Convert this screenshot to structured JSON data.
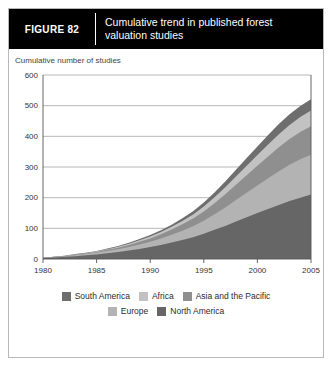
{
  "figure": {
    "label": "FIGURE  82",
    "title": "Cumulative trend in published forest valuation studies"
  },
  "axis_caption": "Cumulative number of studies",
  "colors": {
    "south_america": "#6e6e6e",
    "africa": "#c2c2c2",
    "asia_pacific": "#8f8f8f",
    "europe": "#b3b3b3",
    "north_america": "#666666",
    "gridline": "#9a9a9a",
    "axis": "#555555",
    "header_bg": "#000000",
    "card_border": "#b9b9b9"
  },
  "legend": {
    "row1": [
      {
        "label": "South America",
        "color_key": "south_america"
      },
      {
        "label": "Africa",
        "color_key": "africa"
      },
      {
        "label": "Asia and the Pacific",
        "color_key": "asia_pacific"
      }
    ],
    "row2": [
      {
        "label": "Europe",
        "color_key": "europe"
      },
      {
        "label": "North America",
        "color_key": "north_america"
      }
    ]
  },
  "chart_data": {
    "type": "area",
    "stacked": true,
    "title": "Cumulative trend in published forest valuation studies",
    "xlabel": "",
    "ylabel": "Cumulative number of studies",
    "xlim": [
      1980,
      2005
    ],
    "ylim": [
      0,
      600
    ],
    "ytick_step": 100,
    "xtick_step": 5,
    "grid": true,
    "legend_position": "bottom",
    "xticks": [
      1980,
      1985,
      1990,
      1995,
      2000,
      2005
    ],
    "xtick_labels": [
      "1980",
      "1985",
      "1990",
      "1995",
      "2000",
      "2005"
    ],
    "yticks": [
      0,
      100,
      200,
      300,
      400,
      500,
      600
    ],
    "ytick_labels": [
      "0",
      "100",
      "200",
      "300",
      "400",
      "500",
      "600"
    ],
    "x": [
      1980,
      1981,
      1982,
      1983,
      1984,
      1985,
      1986,
      1987,
      1988,
      1989,
      1990,
      1991,
      1992,
      1993,
      1994,
      1995,
      1996,
      1997,
      1998,
      1999,
      2000,
      2001,
      2002,
      2003,
      2004,
      2005
    ],
    "series": [
      {
        "name": "North America",
        "color_key": "north_america",
        "values": [
          3,
          5,
          7,
          9,
          12,
          15,
          19,
          23,
          28,
          33,
          39,
          46,
          54,
          62,
          71,
          82,
          95,
          108,
          122,
          136,
          150,
          163,
          176,
          189,
          200,
          210
        ]
      },
      {
        "name": "Europe",
        "color_key": "europe",
        "values": [
          1,
          1,
          2,
          3,
          4,
          5,
          7,
          9,
          11,
          14,
          17,
          21,
          25,
          30,
          36,
          43,
          51,
          60,
          70,
          80,
          90,
          100,
          110,
          118,
          125,
          130
        ]
      },
      {
        "name": "Asia and the Pacific",
        "color_key": "asia_pacific",
        "values": [
          0,
          1,
          1,
          2,
          2,
          3,
          4,
          5,
          7,
          9,
          11,
          14,
          17,
          21,
          25,
          30,
          36,
          43,
          50,
          57,
          64,
          71,
          78,
          84,
          89,
          93
        ]
      },
      {
        "name": "Africa",
        "color_key": "africa",
        "values": [
          0,
          0,
          1,
          1,
          1,
          2,
          2,
          3,
          4,
          5,
          6,
          7,
          9,
          11,
          13,
          16,
          19,
          23,
          27,
          31,
          35,
          39,
          43,
          46,
          49,
          51
        ]
      },
      {
        "name": "South America",
        "color_key": "south_america",
        "values": [
          0,
          0,
          0,
          1,
          1,
          1,
          2,
          2,
          3,
          4,
          5,
          6,
          7,
          9,
          11,
          13,
          16,
          19,
          22,
          25,
          28,
          31,
          33,
          35,
          36,
          37
        ]
      }
    ],
    "totals": [
      4,
      7,
      11,
      16,
      20,
      26,
      34,
      42,
      53,
      65,
      78,
      94,
      112,
      133,
      156,
      184,
      217,
      253,
      291,
      329,
      367,
      404,
      440,
      472,
      499,
      521
    ]
  }
}
